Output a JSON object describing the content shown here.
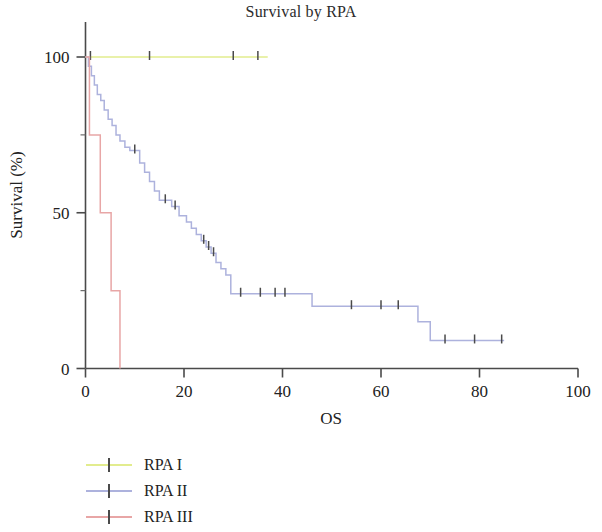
{
  "chart_data": {
    "type": "line",
    "title": "Survival by RPA",
    "xlabel": "OS",
    "ylabel": "Survival (%)",
    "xlim": [
      0,
      100
    ],
    "ylim": [
      0,
      100
    ],
    "xticks": [
      0,
      20,
      40,
      60,
      80,
      100
    ],
    "yticks": [
      0,
      50,
      100
    ],
    "grid": false,
    "legend_position": "below-left",
    "series": [
      {
        "name": "RPA I",
        "color": "#e2ec8e",
        "steps": [
          [
            0,
            100
          ],
          [
            37,
            100
          ]
        ],
        "censor_marks": [
          [
            1,
            100
          ],
          [
            13,
            100
          ],
          [
            30,
            100
          ],
          [
            35,
            100
          ]
        ]
      },
      {
        "name": "RPA II",
        "color": "#adb2dd",
        "steps": [
          [
            0,
            100
          ],
          [
            0.6,
            100
          ],
          [
            0.6,
            97
          ],
          [
            1.2,
            97
          ],
          [
            1.2,
            94
          ],
          [
            1.8,
            94
          ],
          [
            1.8,
            91
          ],
          [
            2.4,
            91
          ],
          [
            2.4,
            88
          ],
          [
            3.1,
            88
          ],
          [
            3.1,
            86
          ],
          [
            3.8,
            86
          ],
          [
            3.8,
            83
          ],
          [
            4.6,
            83
          ],
          [
            4.6,
            80
          ],
          [
            5.4,
            80
          ],
          [
            5.4,
            78
          ],
          [
            6.2,
            78
          ],
          [
            6.2,
            75
          ],
          [
            7.0,
            75
          ],
          [
            7.0,
            73
          ],
          [
            8.0,
            73
          ],
          [
            8.0,
            71
          ],
          [
            9.0,
            71
          ],
          [
            9.0,
            70
          ],
          [
            11.0,
            70
          ],
          [
            11.0,
            66
          ],
          [
            12.0,
            66
          ],
          [
            12.0,
            63
          ],
          [
            13.0,
            63
          ],
          [
            13.0,
            60
          ],
          [
            14.0,
            60
          ],
          [
            14.0,
            57
          ],
          [
            15.0,
            57
          ],
          [
            15.0,
            54
          ],
          [
            17.5,
            54
          ],
          [
            17.5,
            52
          ],
          [
            19.0,
            52
          ],
          [
            19.0,
            49
          ],
          [
            20.5,
            49
          ],
          [
            20.5,
            47
          ],
          [
            21.5,
            47
          ],
          [
            21.5,
            45
          ],
          [
            22.5,
            45
          ],
          [
            22.5,
            43
          ],
          [
            23.5,
            43
          ],
          [
            23.5,
            41
          ],
          [
            24.5,
            41
          ],
          [
            24.5,
            39
          ],
          [
            25.5,
            39
          ],
          [
            25.5,
            37
          ],
          [
            26.5,
            37
          ],
          [
            26.5,
            34
          ],
          [
            27.5,
            34
          ],
          [
            27.5,
            32
          ],
          [
            28.5,
            32
          ],
          [
            28.5,
            30
          ],
          [
            29.5,
            30
          ],
          [
            29.5,
            24
          ],
          [
            46.0,
            24
          ],
          [
            46.0,
            20
          ],
          [
            67.5,
            20
          ],
          [
            67.5,
            15
          ],
          [
            70.0,
            15
          ],
          [
            70.0,
            9
          ],
          [
            85.0,
            9
          ]
        ],
        "censor_marks": [
          [
            10.0,
            70
          ],
          [
            16.2,
            54
          ],
          [
            18.2,
            52
          ],
          [
            24.0,
            41
          ],
          [
            25.0,
            39
          ],
          [
            26.0,
            37
          ],
          [
            31.5,
            24
          ],
          [
            35.5,
            24
          ],
          [
            38.5,
            24
          ],
          [
            40.5,
            24
          ],
          [
            54.0,
            20
          ],
          [
            60.0,
            20
          ],
          [
            63.5,
            20
          ],
          [
            73.0,
            9
          ],
          [
            79.0,
            9
          ],
          [
            84.5,
            9
          ]
        ]
      },
      {
        "name": "RPA III",
        "color": "#e8a6a6",
        "steps": [
          [
            0,
            100
          ],
          [
            0.8,
            100
          ],
          [
            0.8,
            75
          ],
          [
            3.0,
            75
          ],
          [
            3.0,
            50
          ],
          [
            5.2,
            50
          ],
          [
            5.2,
            25
          ],
          [
            7.0,
            25
          ],
          [
            7.0,
            0
          ]
        ],
        "censor_marks": []
      }
    ]
  },
  "legend": {
    "items": [
      {
        "label": "RPA I",
        "color": "#e2ec8e"
      },
      {
        "label": "RPA II",
        "color": "#adb2dd"
      },
      {
        "label": "RPA III",
        "color": "#e8a6a6"
      }
    ]
  }
}
